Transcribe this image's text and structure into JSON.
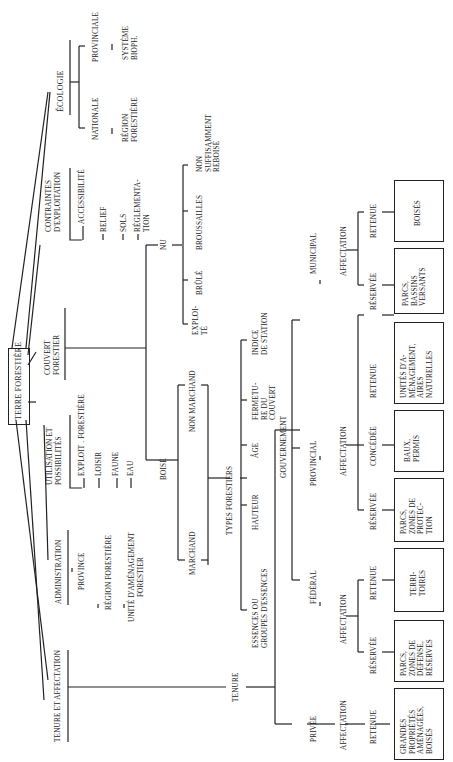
{
  "root": "TERRE FORESTIÈRE",
  "branches": {
    "ecologie": {
      "label": "ÉCOLOGIE",
      "nationale": "NATIONALE",
      "region_forestiere": "RÉGION\nFORESTIÈRE",
      "provinciale": "PROVINCIALE",
      "systeme": "SYSTÈME\nBIOPH."
    },
    "contraintes": {
      "label": "CONTRAINTES\nD'EXPLOITATION",
      "items": [
        "ACCESSIBILITÉ",
        "RELIEF",
        "SOLS",
        "RÉGLEMENTA-\nTION"
      ]
    },
    "couvert": {
      "label": "COUVERT\nFORESTIER",
      "nu": "NU",
      "nu_items": [
        "EXPLOI-\nTÉ",
        "BRÛLÉ",
        "BROUSSAILLES",
        "NON\nSUFFISAMMENT\nREBOISÉ"
      ],
      "boise": "BOISÉ",
      "marchand": "MARCHAND",
      "non_marchand": "NON MARCHAND",
      "types": "TYPES FORESTIERS",
      "types_items": [
        "ESSENCES OU\nGROUPES D'ESSENCES",
        "HAUTEUR",
        "ÂGE",
        "FERMETU-\nRE DU\nCOUVERT",
        "INDICE\nDE STATION"
      ]
    },
    "utilisation": {
      "label": "UTILISATION ET\nPOSSIBILITÉS",
      "items": [
        "EXPLOIT . FORESTIÈRE",
        "LOISIR",
        "FAUNE",
        "EAU"
      ]
    },
    "administration": {
      "label": "ADMINISTRATION",
      "items": [
        "PROVINCE",
        "RÉGION FORESTIÈRE",
        "UNITÉ D'AMÉNAGEMENT\nFORESTIER"
      ]
    },
    "tenure_affectation": {
      "label": "TENURE ET AFFECTATION",
      "tenure": "TENURE",
      "privee": {
        "label": "PRIVÉE",
        "affectation": "AFFECTATION",
        "retenue": "RETENUE",
        "box": "GRANDES\nPROPRIÉTÉS\nAMÉNAGÉES,\nBOISÉS"
      },
      "gouvernement": {
        "label": "GOUVERNEMENT",
        "federal": {
          "label": "FÉDÉRAL",
          "affectation": "AFFECTATION",
          "reservee": "RÉSERVÉE",
          "reservee_box": "PARCS,\nZONES DE\nDÉFENSE,\nRÉSERVES",
          "retenue": "RETENUE",
          "retenue_box": "TERRI-\nTOIRES"
        },
        "provincial": {
          "label": "PROVINCIAL",
          "affectation": "AFFECTATION",
          "reservee": "RÉSERVÉE",
          "reservee_box": "PARCS,\nZONES DE\nPROTEC-\nTION",
          "concedee": "CONCÉDÉE",
          "concedee_box": "BAUX,\nPERMIS",
          "retenue": "RETENUE",
          "retenue_box": "UNITÉS D'A-\nMÉNAGEMENT,\nAIRES\nNATURELLES"
        },
        "municipal": {
          "label": "MUNICIPAL",
          "affectation": "AFFECTATION",
          "reservee": "RÉSERVÉE",
          "reservee_box": "PARCS,\nBASSINS\nVERSANTS",
          "retenue": "RETENUE",
          "retenue_box": "BOISÉS"
        }
      }
    }
  }
}
